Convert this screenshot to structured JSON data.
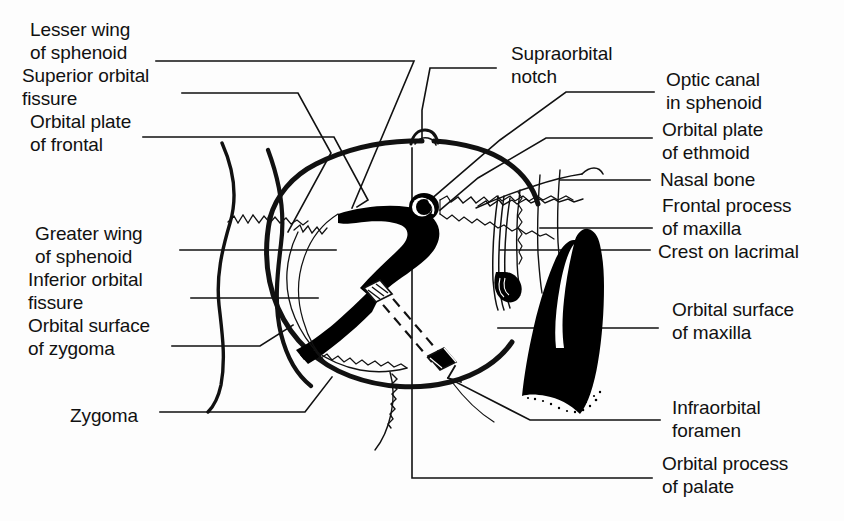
{
  "figure": {
    "line_color": "#111111",
    "fill_color": "#000000",
    "background": "#ffffff"
  },
  "labels": {
    "left": [
      {
        "id": "lesser-wing-of-sphenoid",
        "text": "Lesser wing\nof sphenoid",
        "x": 30,
        "y": 18
      },
      {
        "id": "superior-orbital-fissure",
        "text": "Superior orbital\nfissure",
        "x": 22,
        "y": 64
      },
      {
        "id": "orbital-plate-of-frontal",
        "text": "Orbital plate\nof frontal",
        "x": 30,
        "y": 110
      },
      {
        "id": "greater-wing-of-sphenoid",
        "text": "Greater wing\nof sphenoid",
        "x": 35,
        "y": 222
      },
      {
        "id": "inferior-orbital-fissure",
        "text": "Inferior orbital\nfissure",
        "x": 28,
        "y": 268
      },
      {
        "id": "orbital-surface-of-zygoma",
        "text": "Orbital surface\nof zygoma",
        "x": 28,
        "y": 314
      },
      {
        "id": "zygoma",
        "text": "Zygoma",
        "x": 70,
        "y": 404
      }
    ],
    "top": [
      {
        "id": "supraorbital-notch",
        "text": "Supraorbital\nnotch",
        "x": 511,
        "y": 42
      }
    ],
    "right": [
      {
        "id": "optic-canal-in-sphenoid",
        "text": "Optic canal\nin sphenoid",
        "x": 666,
        "y": 68
      },
      {
        "id": "orbital-plate-of-ethmoid",
        "text": "Orbital plate\nof ethmoid",
        "x": 662,
        "y": 118
      },
      {
        "id": "nasal-bone",
        "text": "Nasal bone",
        "x": 660,
        "y": 168
      },
      {
        "id": "frontal-process-of-maxilla",
        "text": "Frontal process\nof maxilla",
        "x": 662,
        "y": 194
      },
      {
        "id": "crest-on-lacrimal",
        "text": "Crest on lacrimal",
        "x": 658,
        "y": 240
      },
      {
        "id": "orbital-surface-of-maxilla",
        "text": "Orbital surface\nof maxilla",
        "x": 672,
        "y": 298
      },
      {
        "id": "infraorbital-foramen",
        "text": "Infraorbital\nforamen",
        "x": 672,
        "y": 396
      },
      {
        "id": "orbital-process-of-palate",
        "text": "Orbital process\nof palate",
        "x": 662,
        "y": 452
      }
    ]
  },
  "structures": [
    {
      "id": "orbital-rim",
      "name": "orbital-rim-outline"
    },
    {
      "id": "optic-canal",
      "name": "optic-canal-foramen"
    },
    {
      "id": "supraorbital-notch",
      "name": "supraorbital-notch-bump"
    },
    {
      "id": "superior-orbital-fissure",
      "name": "superior-orbital-fissure-fill"
    },
    {
      "id": "inferior-orbital-fissure",
      "name": "inferior-orbital-fissure-fill"
    },
    {
      "id": "maxilla-shaded",
      "name": "orbital-surface-of-maxilla-fill"
    },
    {
      "id": "lacrimal-crest",
      "name": "crest-on-lacrimal-lines"
    },
    {
      "id": "infraorbital-probe",
      "name": "infraorbital-canal-probe"
    },
    {
      "id": "ethmoid-plate",
      "name": "orbital-plate-of-ethmoid-region"
    },
    {
      "id": "nasal-bone",
      "name": "nasal-bone-region"
    }
  ]
}
